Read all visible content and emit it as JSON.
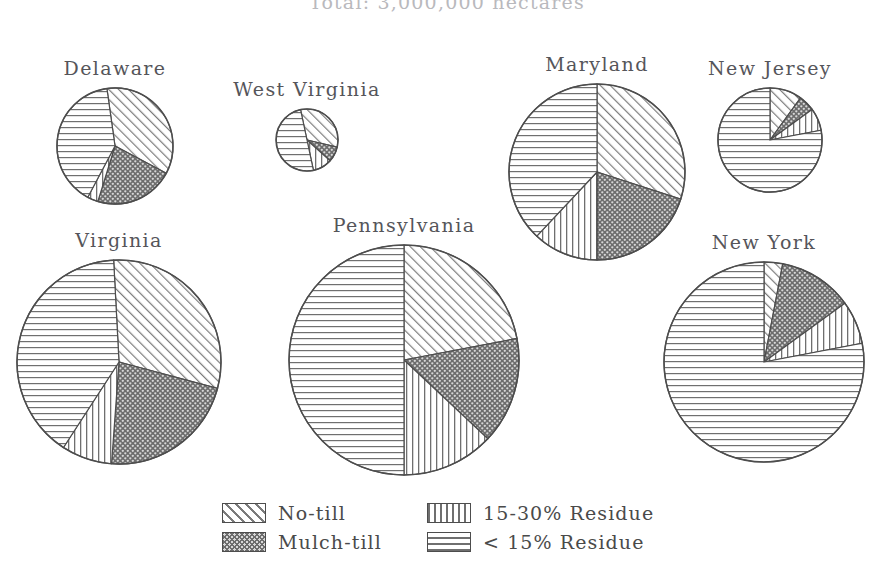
{
  "title": "Total: 3,000,000 hectares",
  "legend": {
    "items": [
      {
        "label": "No-till",
        "pattern": "diagonal",
        "key": "no_till"
      },
      {
        "label": "Mulch-till",
        "pattern": "dotted",
        "key": "mulch_till"
      },
      {
        "label": "15-30% Residue",
        "pattern": "vertical",
        "key": "res_15_30"
      },
      {
        "label": "< 15% Residue",
        "pattern": "horizontal",
        "key": "res_under_15"
      }
    ]
  },
  "chart_data": {
    "type": "pie",
    "title": "Total: 3,000,000 hectares",
    "subtitle": "",
    "xlabel": "",
    "ylabel": "",
    "legend_position": "bottom-center",
    "grid": false,
    "units": "percent of state cropland area",
    "note": "Pie area is proportional to each state's total cropland hectares",
    "categories": [
      "No-till",
      "Mulch-till",
      "15-30% Residue",
      "< 15% Residue"
    ],
    "series": [
      {
        "name": "Delaware",
        "label": "Delaware",
        "radius_px": 58,
        "values": [
          35,
          22,
          3,
          40
        ],
        "start_angle_deg": -8
      },
      {
        "name": "West Virginia",
        "label": "West Virginia",
        "radius_px": 31,
        "values": [
          32,
          8,
          10,
          50
        ],
        "start_angle_deg": -12
      },
      {
        "name": "Maryland",
        "label": "Maryland",
        "radius_px": 88,
        "values": [
          30,
          20,
          12,
          38
        ],
        "start_angle_deg": 0
      },
      {
        "name": "New Jersey",
        "label": "New Jersey",
        "radius_px": 52,
        "values": [
          10,
          5,
          7,
          78
        ],
        "start_angle_deg": 0
      },
      {
        "name": "Virginia",
        "label": "Virginia",
        "radius_px": 102,
        "values": [
          30,
          22,
          8,
          40
        ],
        "start_angle_deg": -3
      },
      {
        "name": "Pennsylvania",
        "label": "Pennsylvania",
        "radius_px": 115,
        "values": [
          22,
          15,
          13,
          50
        ],
        "start_angle_deg": 0
      },
      {
        "name": "New York",
        "label": "New York",
        "radius_px": 100,
        "values": [
          3,
          12,
          7,
          78
        ],
        "start_angle_deg": 0
      }
    ]
  },
  "layout": {
    "pies": [
      {
        "key": "Delaware",
        "cx": 115,
        "cy": 146,
        "label_top": -28
      },
      {
        "key": "West Virginia",
        "cx": 307,
        "cy": 140,
        "label_top": -28
      },
      {
        "key": "Maryland",
        "cx": 597,
        "cy": 172,
        "label_top": -28
      },
      {
        "key": "New Jersey",
        "cx": 770,
        "cy": 140,
        "label_top": -28
      },
      {
        "key": "Virginia",
        "cx": 119,
        "cy": 362,
        "label_top": -28
      },
      {
        "key": "Pennsylvania",
        "cx": 404,
        "cy": 360,
        "label_top": -28
      },
      {
        "key": "New York",
        "cx": 764,
        "cy": 362,
        "label_top": -28
      }
    ]
  }
}
